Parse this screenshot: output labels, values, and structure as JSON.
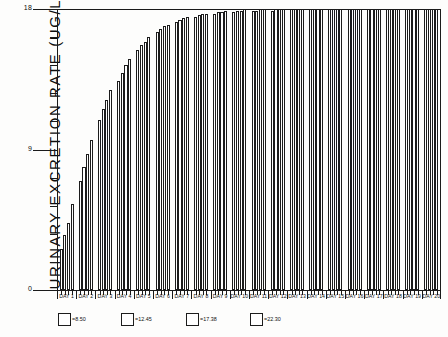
{
  "chart_data": {
    "type": "bar",
    "title": "",
    "xlabel": "",
    "ylabel": "URINARY EXCRETION RATE (UG/L)",
    "ylim": [
      0,
      18
    ],
    "y_tick_labels": [
      "0",
      "9",
      "18"
    ],
    "y_major_ticks": [
      0,
      9,
      18
    ],
    "y_minor_ticks": [
      1.8,
      3.6,
      5.4,
      7.2,
      10.8,
      12.6,
      14.4,
      16.2
    ],
    "grid": false,
    "legend_position": "bottom",
    "categories": [
      "DAY 1",
      "DAY 2",
      "DAY 3",
      "DAY 4",
      "DAY 5",
      "DAY 6",
      "DAY 7",
      "DAY 8",
      "DAY 9",
      "DAY 10",
      "DAY 11",
      "DAY 12",
      "DAY 13",
      "DAY 14",
      "DAY 15",
      "DAY 16",
      "DAY 17",
      "DAY 18",
      "DAY 19",
      "DAY 20"
    ],
    "series": [
      {
        "name": "8.50",
        "values": [
          2.6,
          7.0,
          10.9,
          13.4,
          15.4,
          16.5,
          17.2,
          17.5,
          17.7,
          17.8,
          17.9,
          17.9,
          18.0,
          18.0,
          18.0,
          18.0,
          18.0,
          18.0,
          18.0,
          18.0
        ]
      },
      {
        "name": "12.45",
        "values": [
          3.5,
          7.9,
          11.6,
          13.9,
          15.7,
          16.7,
          17.3,
          17.6,
          17.8,
          17.9,
          17.9,
          18.0,
          18.0,
          18.0,
          18.0,
          18.0,
          18.0,
          18.0,
          18.0,
          18.0
        ]
      },
      {
        "name": "17.38",
        "values": [
          4.3,
          8.7,
          12.2,
          14.4,
          15.9,
          16.9,
          17.4,
          17.7,
          17.8,
          17.9,
          18.0,
          18.0,
          18.0,
          18.0,
          18.0,
          18.0,
          18.0,
          18.0,
          18.0,
          18.0
        ]
      },
      {
        "name": "22.30",
        "values": [
          5.5,
          9.6,
          12.8,
          14.8,
          16.2,
          17.0,
          17.5,
          17.7,
          17.9,
          18.0,
          18.0,
          18.0,
          18.0,
          18.0,
          18.0,
          18.0,
          18.0,
          18.0,
          18.0,
          18.0
        ]
      }
    ]
  },
  "legend": {
    "entries": [
      {
        "label": "=8.50"
      },
      {
        "label": "=12.45"
      },
      {
        "label": "=17.38"
      },
      {
        "label": "=22.30"
      }
    ]
  }
}
